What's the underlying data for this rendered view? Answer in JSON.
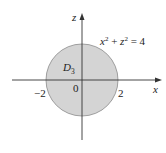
{
  "diagram": {
    "axes": {
      "x_label": "x",
      "z_label": "z",
      "origin_label": "0"
    },
    "ticks": {
      "neg": "−2",
      "pos": "2"
    },
    "region": {
      "name_base": "D",
      "name_sub": "3",
      "fill": "#d4d4d4",
      "stroke": "#8a8a8a"
    },
    "equation": {
      "x": "x",
      "exp1": "2",
      "plus": " + ",
      "z": "z",
      "exp2": "2",
      "rhs": " = 4"
    },
    "colors": {
      "axis": "#333333"
    }
  }
}
